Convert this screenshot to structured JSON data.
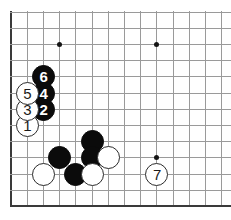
{
  "diagram": {
    "kind": "go-board-diagram",
    "board": {
      "origin_x": 11,
      "origin_y": 12,
      "spacing": 16.2,
      "columns": 14,
      "rows": 13,
      "line_color": "#9a9a9a",
      "edge_color": "#3a3a3a",
      "background_color": "#ffffff",
      "edges": {
        "left": true,
        "top": false,
        "right": false,
        "bottom": true
      }
    },
    "star_points": [
      {
        "col": 3,
        "row": 2
      },
      {
        "col": 9,
        "row": 2
      },
      {
        "col": 9,
        "row": 9
      }
    ],
    "stones": [
      {
        "color": "white",
        "label": "1",
        "col": 1,
        "row": 7
      },
      {
        "color": "black",
        "label": "2",
        "col": 2,
        "row": 6
      },
      {
        "color": "white",
        "label": "3",
        "col": 1,
        "row": 6
      },
      {
        "color": "black",
        "label": "4",
        "col": 2,
        "row": 5
      },
      {
        "color": "white",
        "label": "5",
        "col": 1,
        "row": 5
      },
      {
        "color": "black",
        "label": "6",
        "col": 2,
        "row": 4
      },
      {
        "color": "white",
        "label": "7",
        "col": 9,
        "row": 10
      },
      {
        "color": "black",
        "label": "",
        "col": 5,
        "row": 8
      },
      {
        "color": "black",
        "label": "",
        "col": 3,
        "row": 9
      },
      {
        "color": "black",
        "label": "",
        "col": 5,
        "row": 9
      },
      {
        "color": "white",
        "label": "",
        "col": 6,
        "row": 9
      },
      {
        "color": "white",
        "label": "",
        "col": 2,
        "row": 10
      },
      {
        "color": "black",
        "label": "",
        "col": 4,
        "row": 10
      },
      {
        "color": "white",
        "label": "",
        "col": 5,
        "row": 10
      }
    ]
  }
}
